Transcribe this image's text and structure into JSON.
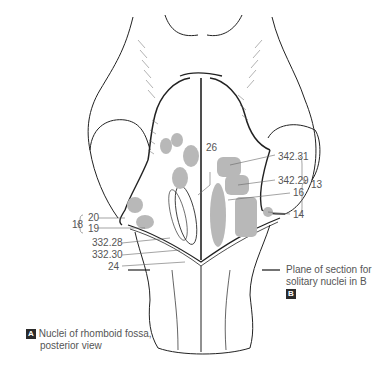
{
  "figure": {
    "title_badge": "A",
    "caption_line1": "Nuclei of rhomboid fossa,",
    "caption_line2": "posterior view",
    "plane_note_line1": "Plane of section for",
    "plane_note_line2": "solitary nuclei in B",
    "plane_badge": "B",
    "nucleus_fill": "#b8b8b8",
    "line_color": "#222222",
    "label_color": "#555555"
  },
  "labels": {
    "l26": "26",
    "l342_31": "342.31",
    "l342_29": "342.29",
    "l13": "13",
    "l16": "16",
    "l14": "14",
    "l18": "18",
    "l20": "20",
    "l19": "19",
    "l332_28": "332.28",
    "l332_30": "332.30",
    "l24": "24"
  }
}
